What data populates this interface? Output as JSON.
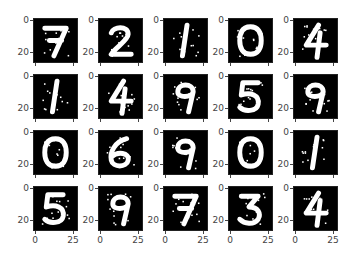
{
  "chart_data": {
    "type": "image-grid",
    "title": "",
    "rows": 4,
    "cols": 5,
    "image_size": [
      28,
      28
    ],
    "colormap": "gray",
    "xticks": [
      "0",
      "25"
    ],
    "yticks": [
      "0",
      "20"
    ],
    "xlabel": "",
    "ylabel": "",
    "digits": [
      [
        "7",
        "2",
        "1",
        "0",
        "4"
      ],
      [
        "1",
        "4",
        "9",
        "5",
        "9"
      ],
      [
        "0",
        "6",
        "9",
        "0",
        "1"
      ],
      [
        "5",
        "9",
        "7",
        "3",
        "4"
      ]
    ],
    "noise": "salt-and-pepper speckle on digits"
  },
  "axes": {
    "ytick_0": "0",
    "ytick_20": "20",
    "xtick_0": "0",
    "xtick_25": "25"
  },
  "colors": {
    "background": "#000000",
    "digit": "#ffffff",
    "figure": "#ffffff"
  }
}
